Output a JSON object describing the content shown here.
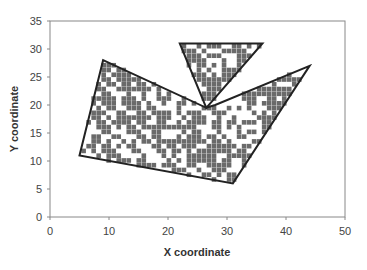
{
  "chart_data": {
    "type": "scatter",
    "title": "",
    "xlabel": "X coordinate",
    "ylabel": "Y coordinate",
    "xlim": [
      0,
      50
    ],
    "ylim": [
      0,
      35
    ],
    "xticks": [
      0,
      10,
      20,
      30,
      40,
      50
    ],
    "yticks": [
      0,
      5,
      10,
      15,
      20,
      25,
      30,
      35
    ],
    "grid": false,
    "legend": null,
    "marker": "square",
    "marker_color": "#6a6a6a",
    "outline_color": "#222222",
    "polygons": [
      {
        "name": "main-region",
        "vertices": [
          [
            9,
            28
          ],
          [
            26.5,
            19.5
          ],
          [
            28,
            20
          ],
          [
            44,
            27
          ],
          [
            31,
            6
          ],
          [
            5,
            11
          ]
        ]
      },
      {
        "name": "triangle-region",
        "vertices": [
          [
            22,
            31
          ],
          [
            36,
            31
          ],
          [
            26.5,
            19.5
          ]
        ]
      }
    ]
  }
}
